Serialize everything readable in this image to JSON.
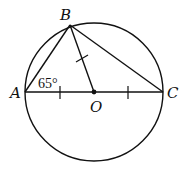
{
  "diagram": {
    "type": "geometry",
    "points": {
      "A": {
        "label": "A"
      },
      "B": {
        "label": "B"
      },
      "C": {
        "label": "C"
      },
      "O": {
        "label": "O"
      }
    },
    "angle_label": "65°",
    "stroke_color": "#111111"
  }
}
